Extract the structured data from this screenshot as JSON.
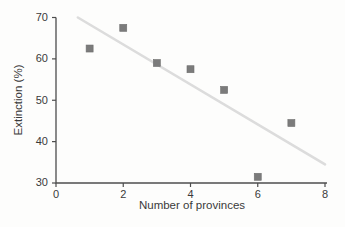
{
  "figure": {
    "background_color": "#fdfdfc"
  },
  "chart_data": {
    "type": "scatter",
    "title": "",
    "xlabel": "Number of provinces",
    "ylabel": "Extinction (%)",
    "xlim": [
      0,
      8
    ],
    "ylim": [
      30,
      70
    ],
    "xticks": [
      0,
      2,
      4,
      6,
      8
    ],
    "yticks": [
      30,
      40,
      50,
      60,
      70
    ],
    "grid": false,
    "legend": false,
    "points": [
      {
        "x": 1,
        "y": 62.5
      },
      {
        "x": 2,
        "y": 67.5
      },
      {
        "x": 3,
        "y": 59
      },
      {
        "x": 4,
        "y": 57.5
      },
      {
        "x": 5,
        "y": 52.5
      },
      {
        "x": 6,
        "y": 31.5
      },
      {
        "x": 7,
        "y": 44.5
      }
    ],
    "trendline": {
      "x1": 0.65,
      "y1": 70,
      "x2": 8,
      "y2": 34.5
    },
    "marker": {
      "shape": "square",
      "size": 7,
      "color": "#7b7b7b",
      "edge_color": "#6f6f6f"
    },
    "trendline_color": "#dcdcdc",
    "axis_color": "#4d4d4d",
    "text_color": "#3a3a3a"
  }
}
